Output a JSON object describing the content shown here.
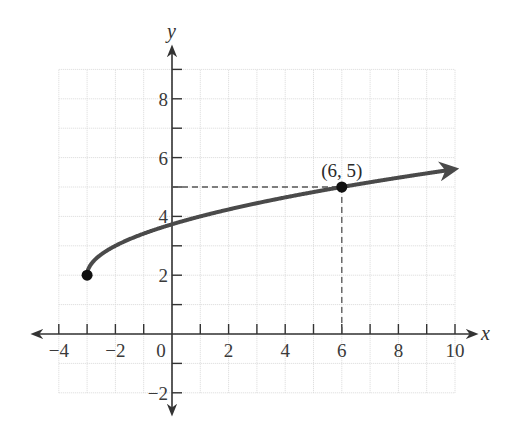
{
  "chart_data": {
    "type": "line",
    "title": "",
    "function": "y = sqrt(x + 3) + 2",
    "xlabel": "x",
    "ylabel": "y",
    "xlim": [
      -4,
      10
    ],
    "ylim": [
      -2,
      9
    ],
    "grid": true,
    "x_ticks": [
      -4,
      -3,
      -2,
      -1,
      0,
      1,
      2,
      3,
      4,
      5,
      6,
      7,
      8,
      9,
      10
    ],
    "x_tick_labels": [
      "-4",
      "-2",
      "0",
      "2",
      "4",
      "6",
      "8",
      "10"
    ],
    "x_tick_label_values": [
      -4,
      -2,
      0,
      2,
      4,
      6,
      8,
      10
    ],
    "y_ticks": [
      -2,
      -1,
      1,
      2,
      3,
      4,
      5,
      6,
      7,
      8,
      9
    ],
    "y_tick_labels": [
      "-2",
      "2",
      "4",
      "6",
      "8"
    ],
    "y_tick_label_values": [
      -2,
      2,
      4,
      6,
      8
    ],
    "series": [
      {
        "name": "f(x) = √(x+3) + 2",
        "x": [
          -3,
          -2.75,
          -2.5,
          -2,
          -1,
          0,
          1,
          2,
          3,
          4,
          5,
          6,
          7,
          8,
          9,
          10
        ],
        "values": [
          2,
          2.5,
          2.71,
          3,
          3.41,
          3.73,
          4,
          4.24,
          4.45,
          4.65,
          4.83,
          5,
          5.16,
          5.32,
          5.46,
          5.61
        ],
        "color": "#4a4a4a",
        "start_point": {
          "x": -3,
          "y": 2,
          "marker": "filled-circle"
        },
        "end": "arrow"
      }
    ],
    "highlighted_points": [
      {
        "x": -3,
        "y": 2,
        "label": ""
      },
      {
        "x": 6,
        "y": 5,
        "label": "(6, 5)"
      }
    ],
    "reference_lines": [
      {
        "type": "dashed",
        "from": [
          0,
          5
        ],
        "to": [
          6,
          5
        ]
      },
      {
        "type": "dashed",
        "from": [
          6,
          5
        ],
        "to": [
          6,
          0
        ]
      }
    ],
    "annotations": [
      {
        "text": "(6, 5)",
        "x": 6,
        "y": 5
      }
    ]
  },
  "colors": {
    "curve": "#4a4a4a",
    "axis": "#333333",
    "grid": "#d9d9d9",
    "point": "#111111",
    "dashed": "#555555"
  }
}
